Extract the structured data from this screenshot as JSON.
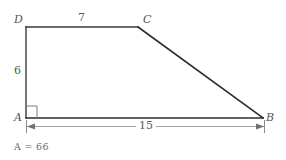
{
  "figure": {
    "kind": "geometry-diagram",
    "shape": "right-trapezoid",
    "vertices": {
      "A": {
        "label": "A",
        "x": 26,
        "y": 118,
        "corner": "bottom-left",
        "right_angle": true
      },
      "B": {
        "label": "B",
        "x": 263,
        "y": 118,
        "corner": "bottom-right"
      },
      "C": {
        "label": "C",
        "x": 138,
        "y": 27,
        "corner": "top-right-of-parallel-side"
      },
      "D": {
        "label": "D",
        "x": 26,
        "y": 27,
        "corner": "top-left"
      }
    },
    "edges": [
      {
        "name": "DC",
        "from": "D",
        "to": "C",
        "measure_label": "7"
      },
      {
        "name": "CB",
        "from": "C",
        "to": "B",
        "measure_label": ""
      },
      {
        "name": "AB",
        "from": "A",
        "to": "B",
        "measure_label": "15"
      },
      {
        "name": "AD",
        "from": "A",
        "to": "D",
        "measure_label": "6"
      }
    ],
    "measures": {
      "top_side": "7",
      "left_side": "6",
      "base_dimension": "15"
    },
    "right_angle_marker": {
      "at": "A",
      "visible": true
    },
    "dimension_line": {
      "for": "AB",
      "value": "15",
      "arrows": "both",
      "ticks": "both"
    },
    "area_statement": {
      "symbol": "A",
      "equals": "=",
      "value": "66",
      "full_text": "A = 66"
    },
    "colors": {
      "stroke": "#2b2b2b",
      "thin_stroke": "#808080",
      "text": "#555555",
      "background": "#ffffff"
    }
  }
}
